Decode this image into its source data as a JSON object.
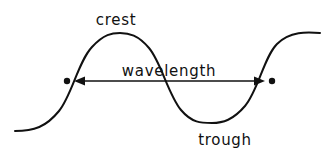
{
  "diagram": {
    "background_color": "#ffffff",
    "stroke_color": "#111111",
    "labels": {
      "crest": "crest",
      "wavelength": "wavelength",
      "trough": "trough"
    },
    "label_positions": {
      "crest": {
        "x": 116,
        "y": 25
      },
      "wavelength": {
        "x": 169,
        "y": 76
      },
      "trough": {
        "x": 225,
        "y": 145
      }
    },
    "wave": {
      "path": "M 15,131 C 34,131 46,127 59,111 C 72,95 78,62 92,47 C 104,34 112,33 120,33 C 129,33 138,35 149,48 C 161,62 168,94 181,110 C 192,123 201,123 212,123 C 223,123 233,120 245,106 C 258,91 264,57 277,44 C 290,31 307,32 320,33",
      "crest_peak": {
        "x": 120,
        "y": 33
      },
      "trough_bottom": {
        "x": 212,
        "y": 123
      },
      "start": {
        "x": 15,
        "y": 131
      },
      "end": {
        "x": 320,
        "y": 33
      }
    },
    "measure": {
      "name": "wavelength",
      "y": 81,
      "left_point": {
        "x": 67,
        "y": 81
      },
      "right_point": {
        "x": 272,
        "y": 81
      },
      "arrow_left_tip": {
        "x": 74,
        "y": 81
      },
      "arrow_right_tip": {
        "x": 265,
        "y": 81
      },
      "line_start": {
        "x": 80,
        "y": 81
      },
      "line_end": {
        "x": 259,
        "y": 81
      },
      "dot_radius": 3.2
    }
  }
}
